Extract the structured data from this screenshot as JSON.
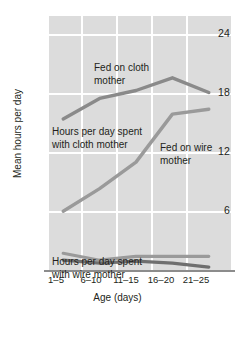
{
  "chart_data": {
    "type": "line",
    "title": "",
    "xlabel": "Age (days)",
    "ylabel": "Mean hours per day",
    "categories": [
      "1–5",
      "6–10",
      "11–15",
      "16–20",
      "21–25"
    ],
    "ylim": [
      0,
      26
    ],
    "yticks": [
      6,
      12,
      18,
      24
    ],
    "ytick_labels": [
      "6",
      "12",
      "18",
      "24"
    ],
    "grid": true,
    "legend": "none",
    "series": [
      {
        "name": "Hours per day spent with cloth mother — fed on cloth mother",
        "color": "#8a8a8a",
        "values": [
          15.5,
          17.6,
          18.4,
          19.7,
          18.2
        ]
      },
      {
        "name": "Hours per day spent with cloth mother — fed on wire mother",
        "color": "#9a9a9a",
        "values": [
          6.1,
          8.4,
          11.1,
          16.0,
          16.5
        ]
      },
      {
        "name": "Hours per day spent with wire mother — fed on wire mother",
        "color": "#9a9a9a",
        "values": [
          1.8,
          1.1,
          1.5,
          1.5,
          1.5
        ]
      },
      {
        "name": "Hours per day spent with wire mother — fed on cloth mother",
        "color": "#6f6f6f",
        "values": [
          1.1,
          0.8,
          1.0,
          0.8,
          0.4
        ]
      }
    ],
    "annotations": [
      {
        "id": "fed-on-cloth-mother",
        "text": "Fed on cloth\nmother"
      },
      {
        "id": "hours-with-cloth",
        "text": "Hours per day spent\nwith cloth mother"
      },
      {
        "id": "fed-on-wire-mother",
        "text": "Fed on wire\nmother"
      },
      {
        "id": "hours-with-wire",
        "text": "Hours per day spent\nwith wire mother"
      }
    ],
    "colors": {
      "plot_background": "#dcdcdc",
      "gridline": "#ffffff",
      "axis": "#8c8c8c",
      "text": "#231f20"
    }
  }
}
